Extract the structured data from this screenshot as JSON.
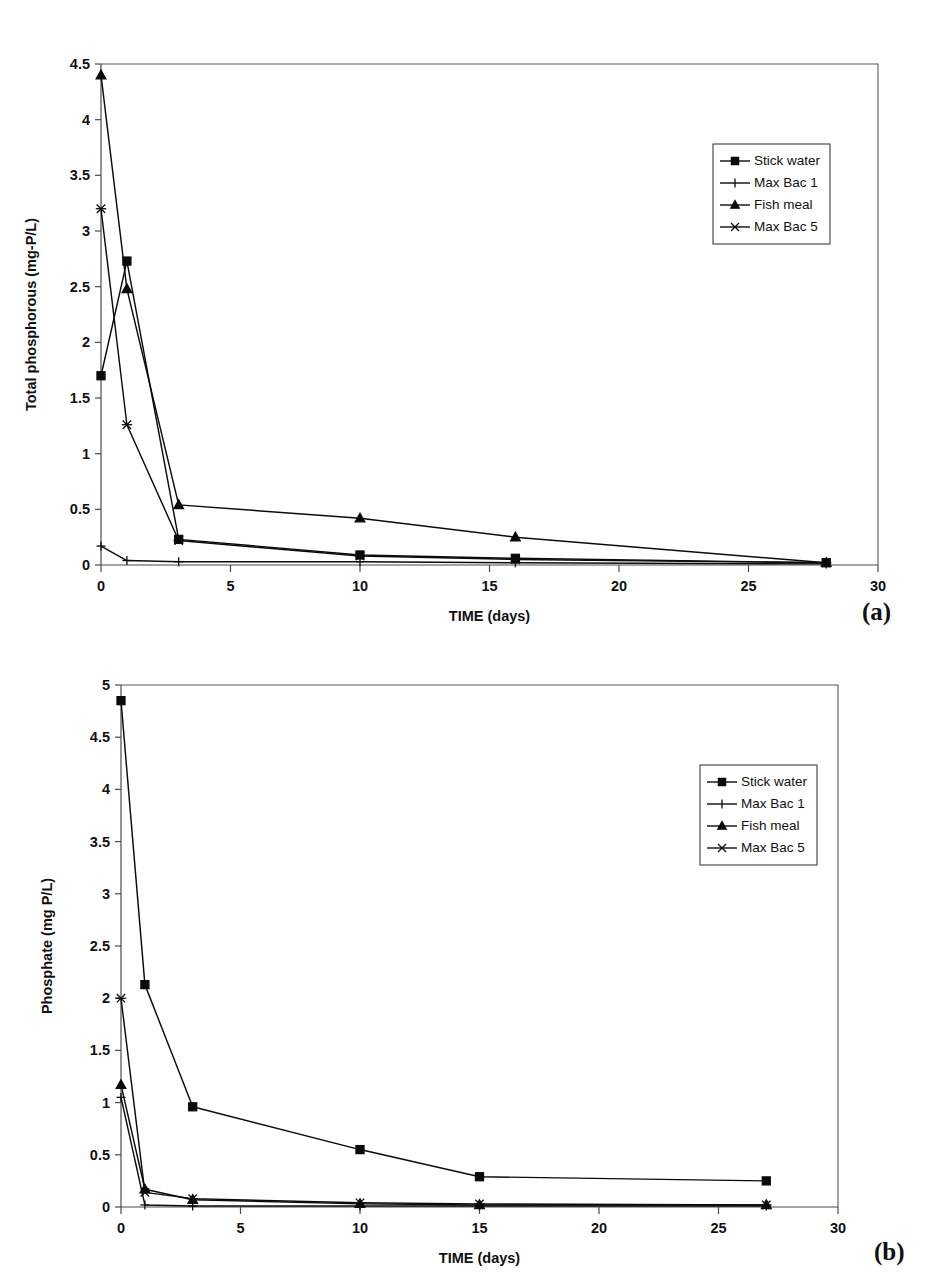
{
  "figure": {
    "panel_a_tag": "(a)",
    "panel_b_tag": "(b)"
  },
  "chart_data": [
    {
      "id": "a",
      "type": "line",
      "title": "",
      "xlabel": "TIME (days)",
      "ylabel": "Total phosphorous (mg-P/L)",
      "xlim": [
        0,
        30
      ],
      "ylim": [
        0,
        4.5
      ],
      "xticks": [
        0,
        5,
        10,
        15,
        20,
        25,
        30
      ],
      "yticks": [
        0,
        0.5,
        1,
        1.5,
        2,
        2.5,
        3,
        3.5,
        4,
        4.5
      ],
      "xticklabels": [
        "0",
        "5",
        "10",
        "15",
        "20",
        "25",
        "30"
      ],
      "yticklabels": [
        "0",
        "0.5",
        "1",
        "1.5",
        "2",
        "2.5",
        "3",
        "3.5",
        "4",
        "4.5"
      ],
      "grid": false,
      "legend_position": "upper right",
      "series": [
        {
          "name": "Stick water",
          "marker": "square",
          "x": [
            0,
            1,
            3,
            10,
            16,
            28
          ],
          "values": [
            1.7,
            2.73,
            0.23,
            0.09,
            0.06,
            0.02
          ]
        },
        {
          "name": "Max Bac 1",
          "marker": "plus",
          "x": [
            0,
            1,
            3,
            10,
            16,
            28
          ],
          "values": [
            0.17,
            0.04,
            0.03,
            0.03,
            0.02,
            0.01
          ]
        },
        {
          "name": "Fish meal",
          "marker": "triangle",
          "x": [
            0,
            1,
            3,
            10,
            16,
            28
          ],
          "values": [
            4.4,
            2.48,
            0.54,
            0.42,
            0.25,
            0.02
          ]
        },
        {
          "name": "Max Bac 5",
          "marker": "cross",
          "x": [
            0,
            1,
            3,
            10,
            16,
            28
          ],
          "values": [
            3.2,
            1.26,
            0.22,
            0.08,
            0.05,
            0.02
          ]
        }
      ]
    },
    {
      "id": "b",
      "type": "line",
      "title": "",
      "xlabel": "TIME (days)",
      "ylabel": "Phosphate (mg P/L)",
      "xlim": [
        0,
        30
      ],
      "ylim": [
        0,
        5
      ],
      "xticks": [
        0,
        5,
        10,
        15,
        20,
        25,
        30
      ],
      "yticks": [
        0,
        0.5,
        1,
        1.5,
        2,
        2.5,
        3,
        3.5,
        4,
        4.5,
        5
      ],
      "xticklabels": [
        "0",
        "5",
        "10",
        "15",
        "20",
        "25",
        "30"
      ],
      "yticklabels": [
        "0",
        "0.5",
        "1",
        "1.5",
        "2",
        "2.5",
        "3",
        "3.5",
        "4",
        "4.5",
        "5"
      ],
      "grid": false,
      "legend_position": "upper right",
      "series": [
        {
          "name": "Stick water",
          "marker": "square",
          "x": [
            0,
            1,
            3,
            10,
            15,
            27
          ],
          "values": [
            4.85,
            2.13,
            0.96,
            0.55,
            0.29,
            0.25
          ]
        },
        {
          "name": "Max Bac 1",
          "marker": "plus",
          "x": [
            0,
            1,
            3,
            10,
            15,
            27
          ],
          "values": [
            1.05,
            0.02,
            0.01,
            0.01,
            0.01,
            0.01
          ]
        },
        {
          "name": "Fish meal",
          "marker": "triangle",
          "x": [
            0,
            1,
            3,
            10,
            15,
            27
          ],
          "values": [
            1.17,
            0.17,
            0.07,
            0.03,
            0.02,
            0.02
          ]
        },
        {
          "name": "Max Bac 5",
          "marker": "cross",
          "x": [
            0,
            1,
            3,
            10,
            15,
            27
          ],
          "values": [
            2.0,
            0.14,
            0.08,
            0.04,
            0.03,
            0.02
          ]
        }
      ]
    }
  ]
}
